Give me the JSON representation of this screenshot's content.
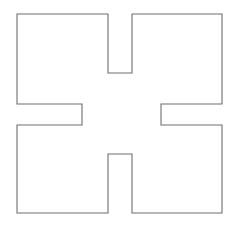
{
  "figure": {
    "kind": "line-drawing",
    "name": "cross-polygon",
    "background_color": "#ffffff",
    "stroke_color": "#6e6e6e",
    "stroke_width": 1.1,
    "fill_color": "#ffffff",
    "canvas": {
      "width": 240,
      "height": 238
    },
    "vertex_count": 20,
    "points": "17,14 108,14 108,73 132,73 132,14 222,14 222,104 161,104 161,125 222,125 222,213 132,213 132,154 108,154 108,213 17,213 17,125 82,125 82,104 17,104",
    "bounds": {
      "left": 17,
      "top": 14,
      "right": 222,
      "bottom": 213,
      "width": 205,
      "height": 199
    },
    "notches": {
      "top": {
        "left": 108,
        "right": 132,
        "depth_y": 73
      },
      "bottom": {
        "left": 108,
        "right": 132,
        "depth_y": 154
      },
      "left": {
        "top": 104,
        "bottom": 125,
        "depth_x": 82
      },
      "right": {
        "top": 104,
        "bottom": 125,
        "depth_x": 161
      }
    }
  }
}
